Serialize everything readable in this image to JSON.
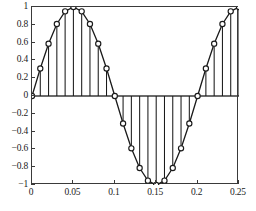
{
  "chart_data": {
    "type": "line",
    "title": "",
    "subtitle": "",
    "xlabel": "",
    "ylabel": "",
    "xlim": [
      0,
      0.25
    ],
    "ylim": [
      -1,
      1
    ],
    "grid": false,
    "legend": null,
    "marker": "circle-open",
    "line_color": "#1a1a1a",
    "stem_color": "#1a1a1a",
    "axis_color": "#3a3a3a",
    "background": "#ffffff",
    "xticks": [
      0,
      0.05,
      0.1,
      0.15,
      0.2,
      0.25
    ],
    "xtick_labels": [
      "0",
      "0.05",
      "0.1",
      "0.15",
      "0.2",
      "0.25"
    ],
    "yticks": [
      -1,
      -0.8,
      -0.6,
      -0.4,
      -0.2,
      0,
      0.2,
      0.4,
      0.6,
      0.8,
      1
    ],
    "ytick_labels": [
      "−1",
      "−0.8",
      "−0.6",
      "−0.4",
      "−0.2",
      "0",
      "0.2",
      "0.4",
      "0.6",
      "0.8",
      "1"
    ],
    "x": [
      0,
      0.01,
      0.02,
      0.03,
      0.04,
      0.05,
      0.06,
      0.07,
      0.08,
      0.09,
      0.1,
      0.11,
      0.12,
      0.13,
      0.14,
      0.15,
      0.16,
      0.17,
      0.18,
      0.19,
      0.2,
      0.21,
      0.22,
      0.23,
      0.24,
      0.25
    ],
    "values": [
      0,
      0.309,
      0.588,
      0.809,
      0.951,
      1,
      0.951,
      0.809,
      0.588,
      0.309,
      0,
      -0.309,
      -0.588,
      -0.809,
      -0.951,
      -1,
      -0.951,
      -0.809,
      -0.588,
      -0.309,
      0,
      0.309,
      0.588,
      0.809,
      0.951,
      1
    ],
    "baseline": 0
  }
}
